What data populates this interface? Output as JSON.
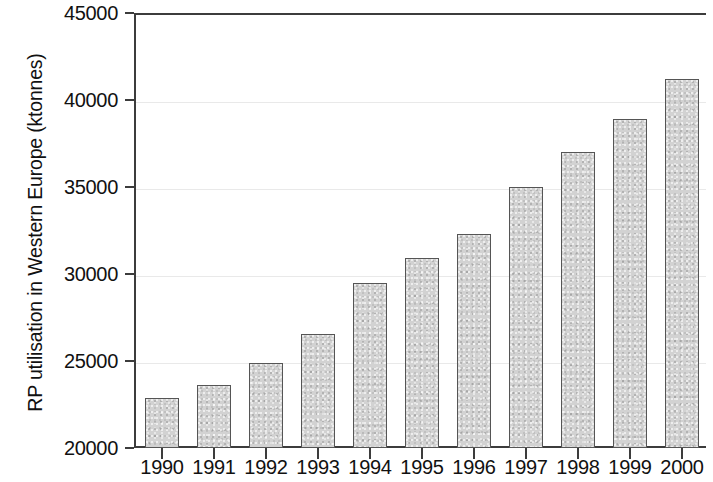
{
  "chart_data": {
    "type": "bar",
    "title": "",
    "xlabel": "",
    "ylabel": "RP utilisation in Western Europe (ktonnes)",
    "categories": [
      "1990",
      "1991",
      "1992",
      "1993",
      "1994",
      "1995",
      "1996",
      "1997",
      "1998",
      "1999",
      "2000"
    ],
    "values": [
      22900,
      23600,
      24900,
      26550,
      29500,
      30900,
      32300,
      35000,
      37000,
      38900,
      41200
    ],
    "ylim": [
      20000,
      45000
    ],
    "yticks": [
      20000,
      25000,
      30000,
      35000,
      40000,
      45000
    ],
    "ytick_labels": [
      "20000",
      "25000",
      "30000",
      "35000",
      "40000",
      "45000"
    ],
    "grid": true,
    "grid_axis": "y",
    "legend": null,
    "bar_fill_color": "#d2d2d2",
    "bar_edge_color": "#555555",
    "axis_color": "#3c3c3c",
    "gridline_color": "#e9e9e9",
    "background_color": "#ffffff"
  }
}
